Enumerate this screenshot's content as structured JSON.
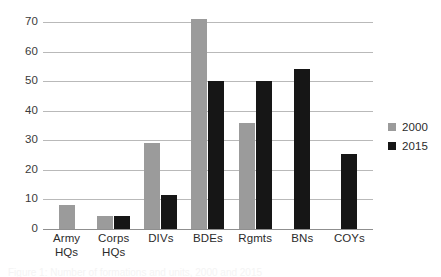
{
  "chart_data": {
    "type": "bar",
    "title": "",
    "subtitle": "",
    "xlabel": "",
    "ylabel": "",
    "categories": [
      "Army HQs",
      "Corps HQs",
      "DIVs",
      "BDEs",
      "Rgmts",
      "BNs",
      "COYs"
    ],
    "category_lines": [
      [
        "Army",
        "HQs"
      ],
      [
        "Corps",
        "HQs"
      ],
      [
        "DIVs"
      ],
      [
        "BDEs"
      ],
      [
        "Rgmts"
      ],
      [
        "BNs"
      ],
      [
        "COYs"
      ]
    ],
    "series": [
      {
        "name": "2000",
        "color": "#9b9b9b",
        "values": [
          8,
          4.5,
          29,
          71,
          36,
          null,
          null
        ]
      },
      {
        "name": "2015",
        "color": "#161616",
        "values": [
          null,
          4.5,
          11.5,
          50,
          50,
          54,
          25.5
        ]
      }
    ],
    "ylim": [
      0,
      70
    ],
    "yticks": [
      0,
      10,
      20,
      30,
      40,
      50,
      60,
      70
    ],
    "ytick_labels": [
      "0",
      "10",
      "20",
      "30",
      "40",
      "50",
      "60",
      "70"
    ],
    "grid": true,
    "grid_axis": "y",
    "legend": {
      "position": "right",
      "entries": [
        {
          "label": "2000",
          "color": "#9b9b9b"
        },
        {
          "label": "2015",
          "color": "#161616"
        }
      ]
    }
  },
  "caption": {
    "cropped_text": "Figure 1: Number of formations and units, 2000 and 2015"
  },
  "colors": {
    "series_2000": "#9b9b9b",
    "series_2015": "#161616",
    "gridline": "#b9b9b9",
    "axis": "#8f8f8f",
    "text": "#2b2b2b",
    "background": "#ffffff"
  }
}
